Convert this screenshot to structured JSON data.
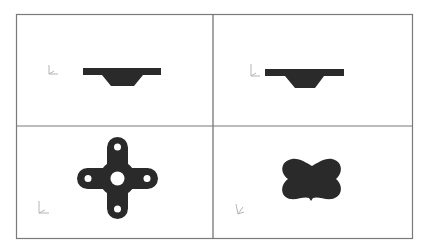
{
  "figure": {
    "layout": "2x2 viewport grid",
    "colors": {
      "border": "#7a7a7a",
      "shape_fill": "#2a2a2a",
      "background": "#ffffff",
      "triad": "#b5b5b5"
    },
    "viewports": [
      {
        "id": "top-left",
        "shape": "flange-profile-front",
        "triad": "axis-triad-icon"
      },
      {
        "id": "top-right",
        "shape": "flange-profile-side",
        "triad": "axis-triad-icon"
      },
      {
        "id": "bottom-left",
        "shape": "cross-plate-with-holes",
        "triad": "axis-triad-icon"
      },
      {
        "id": "bottom-right",
        "shape": "x-shaped-plate",
        "triad": "axis-triad-icon"
      }
    ]
  }
}
